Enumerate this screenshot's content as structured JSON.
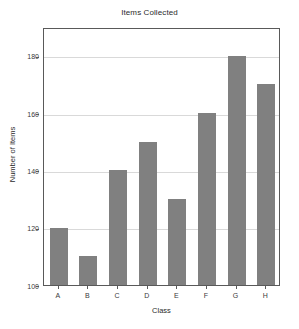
{
  "chart_data": {
    "type": "bar",
    "title": "Items Collected",
    "xlabel": "Class",
    "ylabel": "Number of Items",
    "categories": [
      "A",
      "B",
      "C",
      "D",
      "E",
      "F",
      "G",
      "H"
    ],
    "values": [
      120,
      110,
      140,
      150,
      130,
      160,
      180,
      170
    ],
    "ylim": [
      100,
      190
    ],
    "yticks": [
      100,
      120,
      140,
      160,
      180
    ],
    "ytick_labels": [
      "100",
      "120",
      "140",
      "160",
      "180"
    ],
    "grid": true,
    "legend": false,
    "bar_color": "#808080",
    "grid_color": "#d9d9d9",
    "axis_color": "#595959",
    "background": "#ffffff"
  }
}
